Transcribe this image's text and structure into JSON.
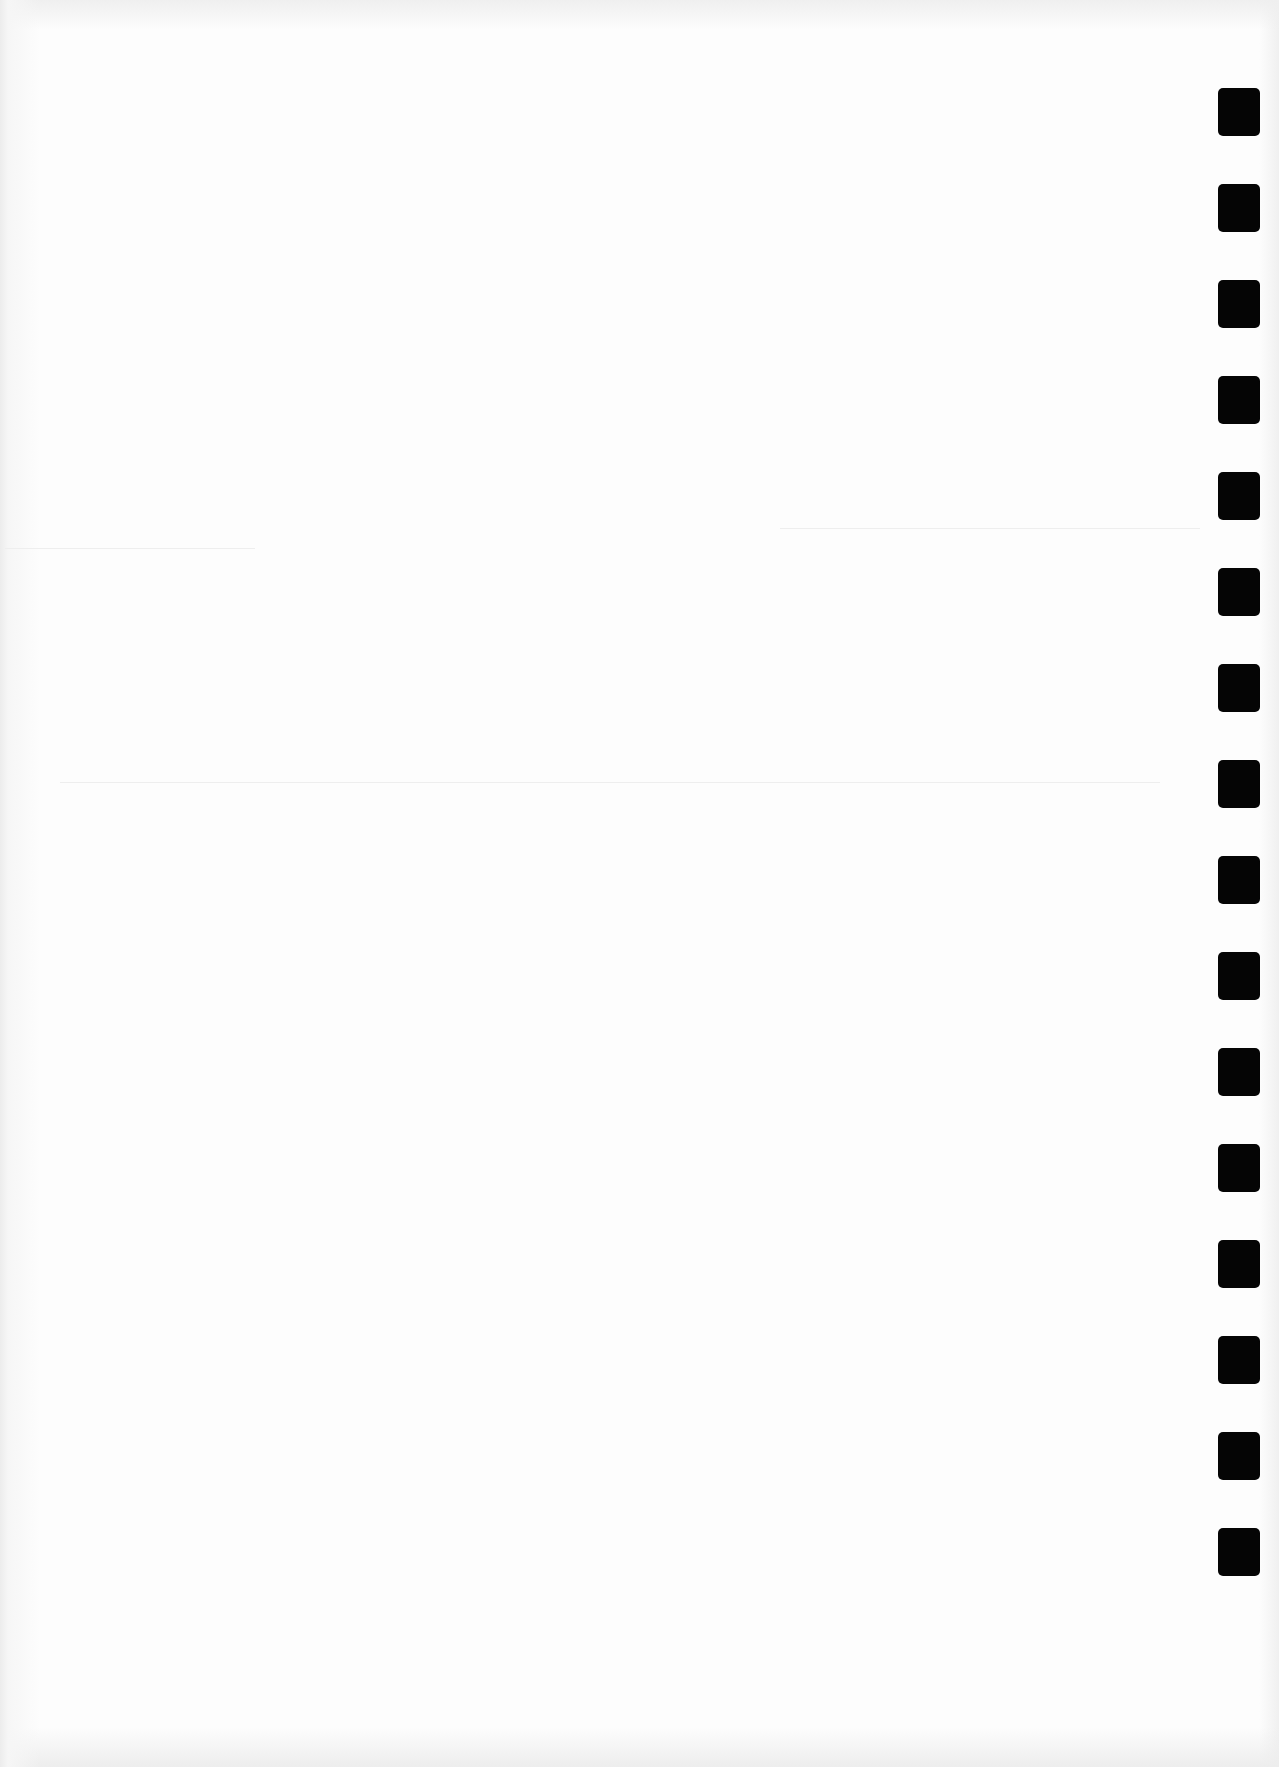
{
  "document": {
    "type": "scanned blank page",
    "background_color": "#fdfdfd",
    "text_content": ""
  },
  "punch_holes": {
    "count": 16,
    "color": "#050505",
    "side": "right",
    "x": 1218,
    "first_y": 88,
    "spacing": 96,
    "width": 42,
    "height": 48
  }
}
